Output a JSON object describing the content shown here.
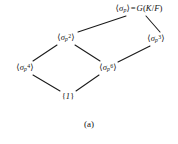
{
  "figure": {
    "caption": "(a)",
    "type": "hasse-diagram",
    "background_color": "#ffffff",
    "line_color": "#1a1a1a",
    "text_color": "#141414"
  },
  "nodes": {
    "top": {
      "id": "sigma-p-full",
      "text": "⟨σp⟩ = G(K/F)",
      "parts": {
        "open_angle": "⟨",
        "sigma": "σ",
        "subscript": "p",
        "close_angle": "⟩",
        "equals": "=",
        "group": "G",
        "open_paren": "(",
        "field_k": "K",
        "slash": "/",
        "field_f": "F",
        "close_paren": ")"
      },
      "x": 139,
      "y": 9
    },
    "left_upper": {
      "id": "sigma-p-2",
      "text": "⟨σp2⟩",
      "parts": {
        "open_angle": "⟨",
        "sigma": "σ",
        "subscript": "p",
        "superscript": "2",
        "close_angle": "⟩"
      },
      "x": 66,
      "y": 38
    },
    "right_upper": {
      "id": "sigma-p-3",
      "text": "⟨σp3⟩",
      "parts": {
        "open_angle": "⟨",
        "sigma": "σ",
        "subscript": "p",
        "superscript": "3",
        "close_angle": "⟩"
      },
      "x": 156,
      "y": 39
    },
    "left_lower": {
      "id": "sigma-p-4",
      "text": "⟨σp4⟩",
      "parts": {
        "open_angle": "⟨",
        "sigma": "σ",
        "subscript": "p",
        "superscript": "4",
        "close_angle": "⟩"
      },
      "x": 25,
      "y": 68
    },
    "middle_lower": {
      "id": "sigma-p-6",
      "text": "⟨σp6⟩",
      "parts": {
        "open_angle": "⟨",
        "sigma": "σ",
        "subscript": "p",
        "superscript": "6",
        "close_angle": "⟩"
      },
      "x": 108,
      "y": 68
    },
    "bottom": {
      "id": "trivial-group",
      "text": "{1}",
      "parts": {
        "open_brace": "{",
        "one": "1",
        "close_brace": "}"
      },
      "x": 68,
      "y": 96
    }
  },
  "edges": [
    {
      "from": "top",
      "to": "left_upper",
      "x1": 126,
      "y1": 16,
      "x2": 78,
      "y2": 32
    },
    {
      "from": "top",
      "to": "right_upper",
      "x1": 146,
      "y1": 16,
      "x2": 160,
      "y2": 32
    },
    {
      "from": "left_upper",
      "to": "left_lower",
      "x1": 57,
      "y1": 45,
      "x2": 33,
      "y2": 61
    },
    {
      "from": "left_upper",
      "to": "middle_lower",
      "x1": 75,
      "y1": 45,
      "x2": 100,
      "y2": 61
    },
    {
      "from": "right_upper",
      "to": "middle_lower",
      "x1": 150,
      "y1": 46,
      "x2": 118,
      "y2": 62
    },
    {
      "from": "left_lower",
      "to": "bottom",
      "x1": 33,
      "y1": 75,
      "x2": 60,
      "y2": 91
    },
    {
      "from": "middle_lower",
      "to": "bottom",
      "x1": 99,
      "y1": 75,
      "x2": 76,
      "y2": 91
    }
  ]
}
